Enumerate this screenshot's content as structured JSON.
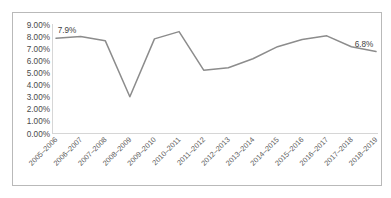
{
  "chart_data": {
    "type": "line",
    "title": "",
    "subtitle": "",
    "xlabel": "",
    "ylabel": "",
    "categories": [
      "2005–2006",
      "2006–2007",
      "2007–2008",
      "2008–2009",
      "2009–2010",
      "2010–2011",
      "2011–2012",
      "2012–2013",
      "2013–2014",
      "2014–2015",
      "2015–2016",
      "2016–2017",
      "2017–2018",
      "2018–2019"
    ],
    "values": [
      7.9,
      8.05,
      7.7,
      3.05,
      7.85,
      8.45,
      5.25,
      5.45,
      6.2,
      7.2,
      7.8,
      8.1,
      7.2,
      6.8
    ],
    "series": [
      {
        "name": "Percentage",
        "values": [
          7.9,
          8.05,
          7.7,
          3.05,
          7.85,
          8.45,
          5.25,
          5.45,
          6.2,
          7.2,
          7.8,
          8.1,
          7.2,
          6.8
        ],
        "color": "#8c8c8c"
      }
    ],
    "ylim": [
      0,
      9
    ],
    "ytick_values": [
      0,
      1,
      2,
      3,
      4,
      5,
      6,
      7,
      8,
      9
    ],
    "ytick_labels": [
      "0.00%",
      "1.00%",
      "2.00%",
      "3.00%",
      "4.00%",
      "5.00%",
      "6.00%",
      "7.00%",
      "8.00%",
      "9.00%"
    ],
    "grid": false,
    "legend": false,
    "legend_position": "none",
    "xtick_rotation_deg": 45,
    "annotations": [
      {
        "text": "7.9%",
        "category": "2005–2006",
        "value": 7.9,
        "position": "above"
      },
      {
        "text": "6.8%",
        "category": "2018–2019",
        "value": 6.8,
        "position": "above"
      }
    ]
  },
  "colors": {
    "line": "#8c8c8c",
    "axis": "#d6d6d6",
    "border": "#b9b9b9",
    "tick_text": "#4a4a4a",
    "xtick_text": "#5a5a5a",
    "label_text": "#3f3f3f",
    "background": "#ffffff"
  }
}
